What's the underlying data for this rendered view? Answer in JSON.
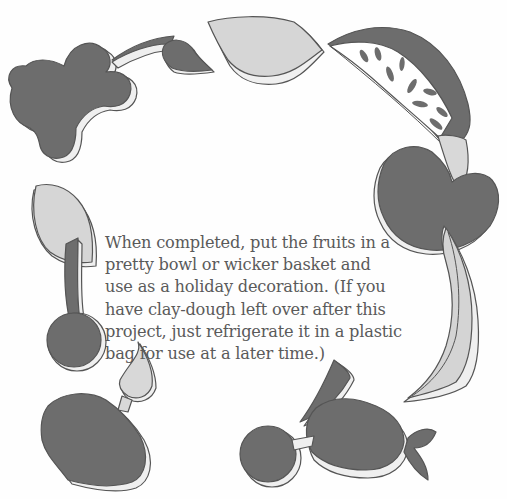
{
  "document": {
    "paragraph_lines": [
      "When completed, put the fruits in a",
      "pretty bowl or wicker basket and",
      "use as a holiday decoration. (If you",
      "have clay-dough left over after this",
      "project, just refrigerate it in a plastic",
      "bag for use at a later time.)"
    ]
  },
  "illustration": {
    "description": "Ring of clay-dough fruit cutouts surrounding the text",
    "shapes": [
      "grape-cluster-with-stem-and-leaf",
      "leaf",
      "watermelon-slice",
      "apple-with-leaf",
      "banana",
      "cherry-with-leaf",
      "strawberry-with-leaf",
      "pear-and-plum"
    ],
    "colors": {
      "dark_fill": "#6f6f6f",
      "light_fill": "#d8d8d8",
      "edge": "#efefef",
      "outline": "#555555"
    }
  }
}
